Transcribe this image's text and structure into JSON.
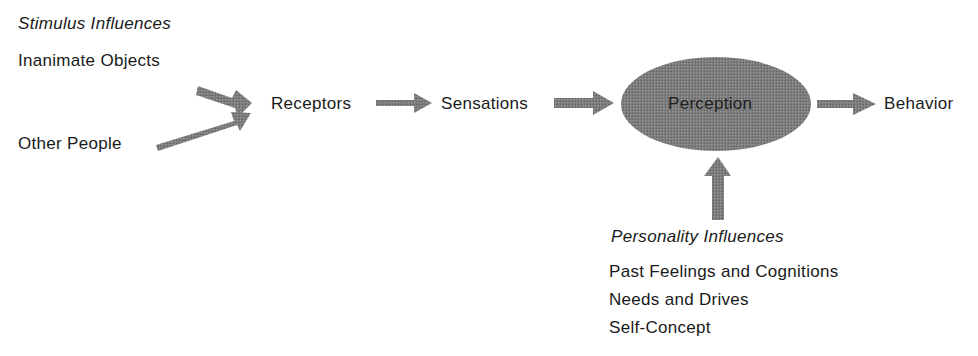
{
  "diagram": {
    "stimulus": {
      "heading": "Stimulus Influences",
      "items": [
        "Inanimate Objects",
        "Other People"
      ]
    },
    "flow": {
      "receptors": "Receptors",
      "sensations": "Sensations",
      "perception": "Perception",
      "behavior": "Behavior"
    },
    "personality": {
      "heading": "Personality Influences",
      "items": [
        "Past Feelings and Cognitions",
        "Needs and Drives",
        "Self-Concept"
      ]
    },
    "colors": {
      "arrow_fill": "#7a7a7a",
      "ellipse_fill": "#7f7f7f",
      "text": "#1a1a1a"
    }
  }
}
